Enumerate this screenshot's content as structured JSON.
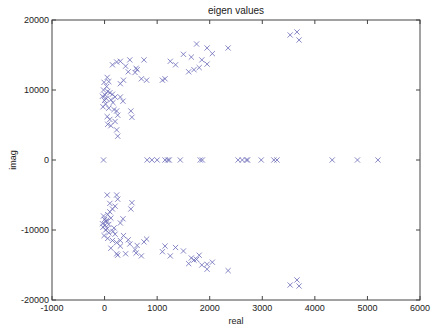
{
  "chart_data": {
    "type": "scatter",
    "title": "eigen values",
    "xlabel": "real",
    "ylabel": "imag",
    "xlim": [
      -1000,
      6000
    ],
    "ylim": [
      -20000,
      20000
    ],
    "xticks": [
      -1000,
      0,
      1000,
      2000,
      3000,
      4000,
      5000,
      6000
    ],
    "yticks": [
      -20000,
      -10000,
      0,
      10000,
      20000
    ],
    "grid": false,
    "legend": null,
    "marker": "x",
    "marker_color": "#6a6ab8",
    "series": [
      {
        "name": "eigenvalues",
        "points": [
          [
            -20,
            0
          ],
          [
            810,
            0
          ],
          [
            900,
            0
          ],
          [
            1000,
            0
          ],
          [
            1150,
            0
          ],
          [
            1200,
            0
          ],
          [
            1230,
            0
          ],
          [
            1440,
            0
          ],
          [
            1820,
            0
          ],
          [
            1860,
            0
          ],
          [
            2540,
            0
          ],
          [
            2620,
            0
          ],
          [
            2700,
            0
          ],
          [
            2720,
            0
          ],
          [
            2980,
            0
          ],
          [
            3220,
            0
          ],
          [
            3280,
            0
          ],
          [
            4330,
            0
          ],
          [
            4810,
            0
          ],
          [
            5200,
            0
          ],
          [
            3530,
            17860
          ],
          [
            3660,
            18290
          ],
          [
            3700,
            17140
          ],
          [
            3530,
            -17860
          ],
          [
            3660,
            -17140
          ],
          [
            3700,
            -18000
          ],
          [
            1750,
            16570
          ],
          [
            2350,
            16000
          ],
          [
            1950,
            16000
          ],
          [
            2050,
            15200
          ],
          [
            1500,
            15100
          ],
          [
            1650,
            14700
          ],
          [
            1850,
            14300
          ],
          [
            1250,
            14100
          ],
          [
            1350,
            13600
          ],
          [
            1800,
            13200
          ],
          [
            1700,
            12900
          ],
          [
            1950,
            13700
          ],
          [
            1600,
            12600
          ],
          [
            1100,
            11400
          ],
          [
            750,
            14300
          ],
          [
            480,
            14300
          ],
          [
            300,
            14100
          ],
          [
            230,
            14000
          ],
          [
            150,
            13600
          ],
          [
            400,
            13400
          ],
          [
            600,
            13100
          ],
          [
            620,
            12900
          ],
          [
            450,
            12600
          ],
          [
            580,
            12500
          ],
          [
            700,
            11600
          ],
          [
            800,
            11400
          ],
          [
            1150,
            11600
          ],
          [
            360,
            11400
          ],
          [
            300,
            10900
          ],
          [
            50,
            11800
          ],
          [
            80,
            11200
          ],
          [
            40,
            10500
          ],
          [
            -20,
            10000
          ],
          [
            60,
            9800
          ],
          [
            100,
            9600
          ],
          [
            150,
            9400
          ],
          [
            200,
            9000
          ],
          [
            -40,
            9100
          ],
          [
            30,
            8800
          ],
          [
            120,
            8600
          ],
          [
            160,
            8200
          ],
          [
            20,
            8000
          ],
          [
            -30,
            7600
          ],
          [
            80,
            7400
          ],
          [
            180,
            7200
          ],
          [
            230,
            7000
          ],
          [
            250,
            6400
          ],
          [
            50,
            6200
          ],
          [
            100,
            5800
          ],
          [
            200,
            5500
          ],
          [
            60,
            5100
          ],
          [
            120,
            4900
          ],
          [
            230,
            4300
          ],
          [
            250,
            3400
          ],
          [
            500,
            7000
          ],
          [
            520,
            6100
          ],
          [
            300,
            9000
          ],
          [
            350,
            8400
          ],
          [
            10,
            9300
          ],
          [
            0,
            8500
          ],
          [
            -10,
            11100
          ],
          [
            -1750,
            0
          ],
          [
            1750,
            -14200
          ],
          [
            2350,
            -15800
          ],
          [
            1950,
            -15600
          ],
          [
            2050,
            -14600
          ],
          [
            1500,
            -13000
          ],
          [
            1650,
            -14000
          ],
          [
            1850,
            -15000
          ],
          [
            1250,
            -13700
          ],
          [
            1350,
            -12500
          ],
          [
            1800,
            -13600
          ],
          [
            1700,
            -14300
          ],
          [
            1950,
            -14900
          ],
          [
            1600,
            -14800
          ],
          [
            1100,
            -13100
          ],
          [
            750,
            -11700
          ],
          [
            480,
            -12000
          ],
          [
            300,
            -12300
          ],
          [
            230,
            -11800
          ],
          [
            150,
            -11500
          ],
          [
            400,
            -13400
          ],
          [
            600,
            -13300
          ],
          [
            620,
            -12200
          ],
          [
            450,
            -11400
          ],
          [
            580,
            -12800
          ],
          [
            700,
            -13700
          ],
          [
            800,
            -11300
          ],
          [
            1150,
            -12300
          ],
          [
            360,
            -10800
          ],
          [
            300,
            -11500
          ],
          [
            50,
            -9800
          ],
          [
            80,
            -9200
          ],
          [
            40,
            -8600
          ],
          [
            -20,
            -8000
          ],
          [
            60,
            -7800
          ],
          [
            100,
            -7400
          ],
          [
            150,
            -7000
          ],
          [
            200,
            -6600
          ],
          [
            -40,
            -9100
          ],
          [
            30,
            -8800
          ],
          [
            120,
            -8300
          ],
          [
            160,
            -10200
          ],
          [
            20,
            -10000
          ],
          [
            -30,
            -9600
          ],
          [
            80,
            -10400
          ],
          [
            180,
            -9700
          ],
          [
            230,
            -5000
          ],
          [
            250,
            -5600
          ],
          [
            50,
            -5000
          ],
          [
            100,
            -6200
          ],
          [
            200,
            -10600
          ],
          [
            60,
            -11200
          ],
          [
            120,
            -12600
          ],
          [
            230,
            -13400
          ],
          [
            250,
            -13600
          ],
          [
            500,
            -7000
          ],
          [
            520,
            -6100
          ],
          [
            300,
            -9000
          ],
          [
            350,
            -8400
          ],
          [
            10,
            -9300
          ],
          [
            0,
            -8500
          ],
          [
            -10,
            -10800
          ]
        ]
      }
    ]
  }
}
